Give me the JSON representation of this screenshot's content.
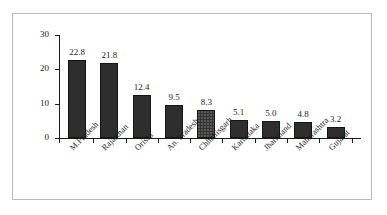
{
  "chart_data": {
    "type": "bar",
    "title": "",
    "subtitle": "",
    "xlabel": "",
    "ylabel": "",
    "ylim": [
      0,
      30
    ],
    "y_ticks": [
      "0",
      "10",
      "20",
      "30"
    ],
    "grid": false,
    "legend": null,
    "categories": [
      "M.Pradesh",
      "Rajasthan",
      "Orissa",
      "An. Pradesh",
      "Chhattisgarh",
      "Karnataka",
      "Jharkhand",
      "Maharashtra",
      "Gujarat"
    ],
    "values": [
      22.8,
      21.8,
      12.4,
      9.5,
      8.3,
      5.1,
      5.0,
      4.8,
      3.2
    ],
    "value_labels": [
      "22.8",
      "21.8",
      "12.4",
      "9.5",
      "8.3",
      "5.1",
      "5.0",
      "4.8",
      "3.2"
    ],
    "series": [
      {
        "name": "",
        "values": [
          22.8,
          21.8,
          12.4,
          9.5,
          8.3,
          5.1,
          5.0,
          4.8,
          3.2
        ]
      }
    ],
    "bar_color": "#2e2e2e",
    "axis_color": "#1a1a1a",
    "background_color": "#ffffff",
    "border_color": "#b9b9b9"
  }
}
